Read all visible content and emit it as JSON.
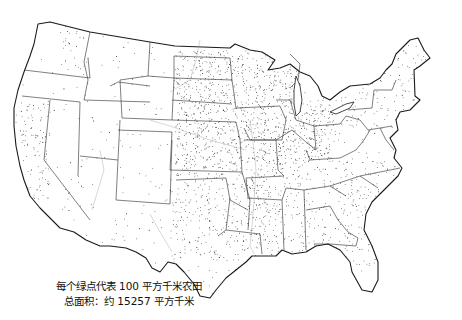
{
  "map": {
    "title": "United States farmland dot-density map",
    "dot_color": "#2b2b2b",
    "border_color": "#1a1a1a",
    "background": "#ffffff"
  },
  "legend": {
    "line1": "每个绿点代表 100 平方千米农田",
    "line2": "总面积：约 15257 平方千米"
  },
  "density_regions": [
    {
      "name": "Northern Plains",
      "level": "high"
    },
    {
      "name": "Corn Belt",
      "level": "very-high"
    },
    {
      "name": "Mississippi Delta",
      "level": "high"
    },
    {
      "name": "Southeast",
      "level": "medium"
    },
    {
      "name": "Mountain West",
      "level": "low"
    },
    {
      "name": "Southwest Desert",
      "level": "very-low"
    },
    {
      "name": "California Central Valley",
      "level": "medium"
    },
    {
      "name": "Northeast",
      "level": "low"
    }
  ]
}
